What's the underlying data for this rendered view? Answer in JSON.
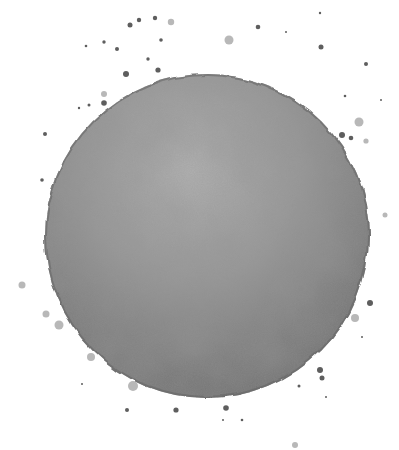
{
  "image": {
    "subject": "Gray watercolor circle with ink splatter",
    "background": "#ffffff",
    "circle": {
      "cx": 207,
      "cy": 236,
      "r": 162,
      "fill_light": "#a9a9a9",
      "fill_mid": "#8c8c8c",
      "fill_dark": "#6e6e6e",
      "edge": "#6a6a6a"
    },
    "splatter_color": "#5e5e5e",
    "splatter_light": "#b8b8b8"
  }
}
